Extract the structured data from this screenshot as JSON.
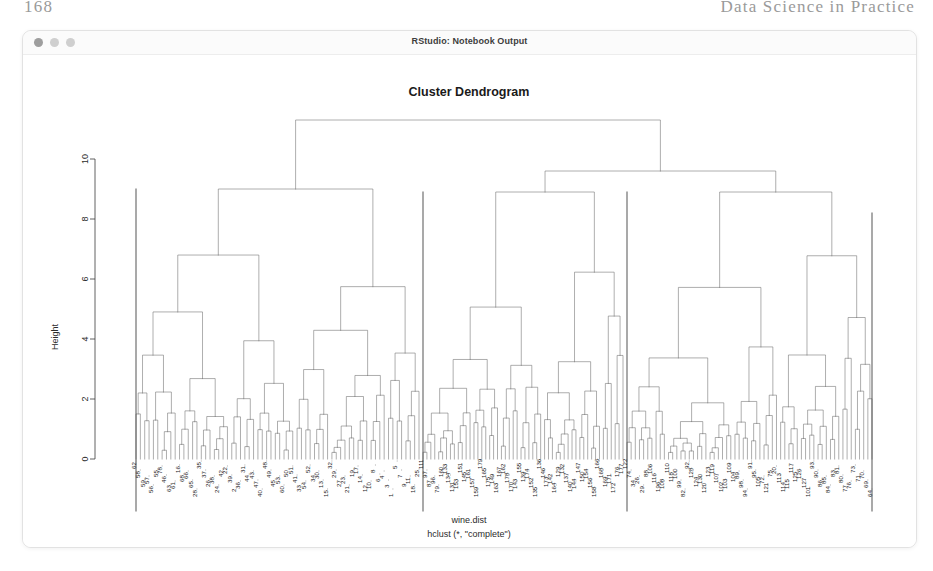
{
  "page": {
    "folio": "168",
    "book_title": "Data Science in Practice",
    "background": "#ffffff"
  },
  "window": {
    "title": "RStudio: Notebook Output",
    "traffic_lights": [
      "close-dot",
      "minimize-dot",
      "zoom-dot"
    ],
    "frame_color": "#e2e2e2",
    "titlebar_color": "#fbfbfb"
  },
  "plot": {
    "title": "Cluster Dendrogram",
    "xlabel_main": "wine.dist",
    "xlabel_sub": "hclust (*, \"complete\")",
    "ylabel": "Height",
    "line_color": "#6b6b6b",
    "axis_color": "#3a3a3a"
  },
  "chart_data": {
    "type": "dendrogram",
    "title": "Cluster Dendrogram",
    "xlabel": "wine.dist\nhclust (*, \"complete\")",
    "ylabel": "Height",
    "ylim": [
      0,
      11.8
    ],
    "yticks": [
      0,
      2,
      4,
      6,
      8,
      10
    ],
    "ytick_labels": [
      "0",
      "2",
      "4",
      "6",
      "8",
      "10"
    ],
    "grid": false,
    "legend": "none",
    "method": "complete",
    "distance": "wine.dist",
    "n_leaves": 178,
    "root_height": 11.3,
    "major_merges": [
      {
        "height": 11.3,
        "children": [
          "left-supercluster",
          "right-supercluster"
        ]
      },
      {
        "height": 9.6,
        "children": [
          "mid-cluster",
          "right-cluster"
        ]
      },
      {
        "height": 9.0,
        "children": [
          "left-a",
          "left-b"
        ]
      },
      {
        "height": 8.9,
        "children": [
          "mid-a",
          "mid-b"
        ]
      },
      {
        "height": 8.9,
        "children": [
          "right-a",
          "right-b"
        ]
      },
      {
        "height": 8.2,
        "children": [
          "right-b1",
          "right-b2"
        ]
      }
    ],
    "clusters": [
      {
        "name": "cluster-1",
        "x_start": 113,
        "x_end": 396,
        "top_height": 9.0,
        "n_leaves": 66,
        "labels": [
          "62",
          "58",
          "59",
          "57",
          "56",
          "55",
          "78",
          "46",
          "63",
          "61",
          "16",
          "68",
          "66",
          "65",
          "28",
          "35",
          "37",
          "26",
          "38",
          "24",
          "42",
          "22",
          "39",
          "2",
          "36",
          "31",
          "44",
          "43",
          "47",
          "40",
          "48",
          "49",
          "45",
          "53",
          "60",
          "50",
          "51",
          "41",
          "33",
          "54",
          "52",
          "34",
          "30",
          "13",
          "15",
          "32",
          "29",
          "27",
          "23",
          "21",
          "19",
          "17",
          "14",
          "12",
          "10",
          "8",
          "6",
          "4",
          "3",
          "1",
          "5",
          "7",
          "9",
          "11",
          "18",
          "25"
        ]
      },
      {
        "name": "cluster-2",
        "x_start": 400,
        "x_end": 600,
        "top_height": 8.9,
        "n_leaves": 52,
        "labels": [
          "111",
          "97",
          "87",
          "96",
          "79",
          "160",
          "133",
          "134",
          "131",
          "153",
          "151",
          "145",
          "161",
          "157",
          "159",
          "179",
          "165",
          "175",
          "149",
          "163",
          "167",
          "162",
          "178",
          "170",
          "143",
          "155",
          "139",
          "174",
          "152",
          "135",
          "136",
          "146",
          "173",
          "142",
          "164",
          "129",
          "132",
          "137",
          "140",
          "144",
          "147",
          "150",
          "154",
          "156",
          "158",
          "166",
          "168",
          "169",
          "171",
          "172",
          "176",
          "177"
        ]
      },
      {
        "name": "cluster-3",
        "x_start": 604,
        "x_end": 849,
        "top_height": 8.9,
        "n_leaves": 60,
        "labels": [
          "122",
          "74",
          "34",
          "26",
          "29",
          "88",
          "106",
          "116",
          "196",
          "108",
          "110",
          "118",
          "100",
          "99",
          "82",
          "92",
          "128",
          "124",
          "130",
          "120",
          "123",
          "119",
          "107",
          "102",
          "103",
          "109",
          "104",
          "89",
          "98",
          "94",
          "91",
          "95",
          "105",
          "72",
          "121",
          "75",
          "20",
          "113",
          "114",
          "115",
          "117",
          "125",
          "126",
          "127",
          "101",
          "93",
          "90",
          "86",
          "85",
          "84",
          "83",
          "81",
          "80",
          "77",
          "76",
          "73",
          "71",
          "70",
          "69",
          "64"
        ]
      }
    ],
    "notable_leaf_labels": [
      "62",
      "78",
      "60",
      "37",
      "22",
      "2",
      "49",
      "52",
      "79",
      "96",
      "87",
      "111",
      "97",
      "160",
      "133",
      "134",
      "131",
      "153",
      "145",
      "178",
      "170",
      "158",
      "142",
      "164",
      "122",
      "74",
      "34",
      "26",
      "29",
      "88",
      "106",
      "116",
      "128",
      "124",
      "130",
      "120",
      "72",
      "121",
      "75",
      "20",
      "64"
    ]
  }
}
